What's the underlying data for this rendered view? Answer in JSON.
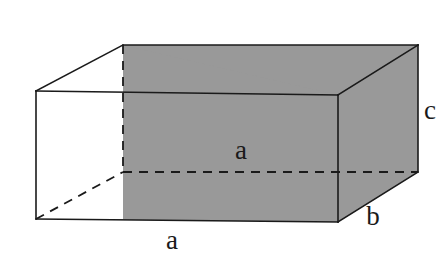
{
  "figure": {
    "canvas": {
      "width": 446,
      "height": 260,
      "background": "#ffffff"
    },
    "style": {
      "face_fill": "#999999",
      "edge_color": "#1a1a1a",
      "hidden_edge_color": "#1a1a1a",
      "open_face_fill": "#ffffff",
      "stroke_width": 1.6,
      "dash_pattern": "9 7"
    },
    "labels": [
      {
        "id": "label-depth-a",
        "text": "a",
        "x": 241,
        "y": 150,
        "edge": "back-bottom-horizontal"
      },
      {
        "id": "label-width-a",
        "text": "a",
        "x": 172,
        "y": 240,
        "edge": "front-bottom-horizontal"
      },
      {
        "id": "label-depth-b",
        "text": "b",
        "x": 373,
        "y": 216,
        "edge": "bottom-right-receding"
      },
      {
        "id": "label-height-c",
        "text": "c",
        "x": 430,
        "y": 110,
        "edge": "back-right-vertical"
      }
    ],
    "vertices": {
      "front_top_left": [
        36,
        91
      ],
      "front_bottom_left": [
        36,
        219
      ],
      "front_top_right": [
        338,
        95
      ],
      "front_bottom_right": [
        338,
        222
      ],
      "back_top_left": [
        123,
        45
      ],
      "back_bottom_left": [
        123,
        172
      ],
      "back_top_right": [
        418,
        45
      ],
      "back_bottom_right": [
        418,
        172
      ]
    }
  }
}
